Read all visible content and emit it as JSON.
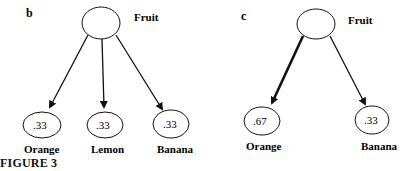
{
  "figure": {
    "caption": "FIGURE 3",
    "panels": [
      {
        "id": "b",
        "label": "b",
        "root": {
          "label": "Fruit"
        },
        "children": [
          {
            "label": "Orange",
            "value": ".33"
          },
          {
            "label": "Lemon",
            "value": ".33"
          },
          {
            "label": "Banana",
            "value": ".33"
          }
        ]
      },
      {
        "id": "c",
        "label": "c",
        "root": {
          "label": "Fruit"
        },
        "children": [
          {
            "label": "Orange",
            "value": ".67",
            "emphasized": true
          },
          {
            "label": "Banana",
            "value": ".33"
          }
        ]
      }
    ],
    "colors": {
      "stroke": "#111111",
      "background": "#ffffff"
    }
  }
}
